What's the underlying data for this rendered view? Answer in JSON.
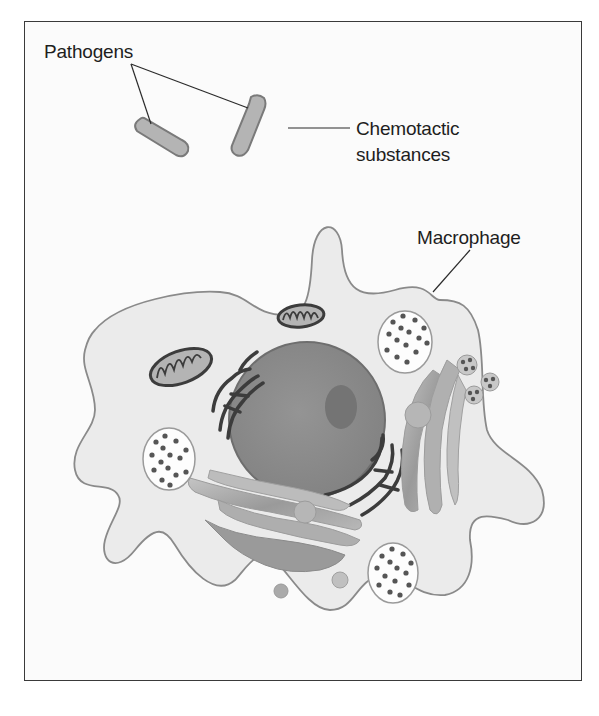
{
  "diagram": {
    "labels": {
      "pathogens": "Pathogens",
      "chemotactic_line1": "Chemotactic",
      "chemotactic_line2": "substances",
      "macrophage": "Macrophage"
    },
    "colors": {
      "frame_border": "#3a3a3a",
      "background": "#fbfbfb",
      "cytoplasm": "#ebebeb",
      "cell_outline": "#8a8a8a",
      "nucleus": "#8c8c8c",
      "nucleolus": "#747474",
      "er": "#3c3c3c",
      "golgi": "#a6a6a6",
      "pathogen": "#b4b4b4",
      "vesicle_dots": "#555555"
    },
    "components": [
      {
        "name": "pathogen",
        "count": 2
      },
      {
        "name": "macrophage-cell",
        "count": 1
      },
      {
        "name": "nucleus",
        "count": 1
      },
      {
        "name": "nucleolus",
        "count": 1
      },
      {
        "name": "mitochondrion",
        "count": 2
      },
      {
        "name": "lysosome-vesicle",
        "count": 3
      },
      {
        "name": "rough-endoplasmic-reticulum",
        "count": 2
      },
      {
        "name": "golgi-apparatus",
        "count": 2
      }
    ]
  }
}
